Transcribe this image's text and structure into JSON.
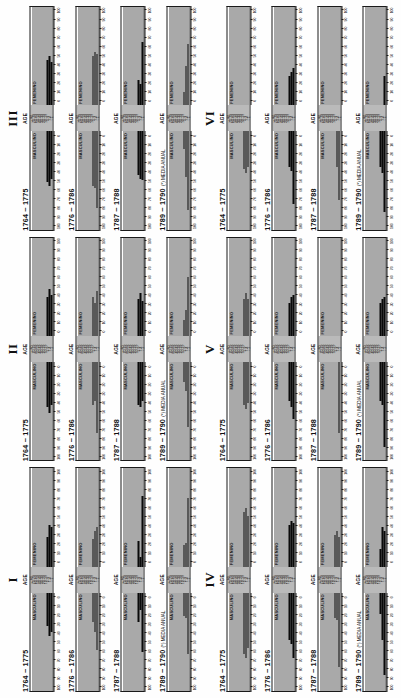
{
  "figure": {
    "orientation": "rotated-90-ccw",
    "panel_count": 6,
    "pyramids_per_panel": 4,
    "axis_header": "AGE",
    "male_label": "MASCULINO",
    "female_label": "FEMENINO",
    "note_symbol": "(*)",
    "note_text": "MEDIA ANUAL",
    "colors": {
      "bar": "#0a0a0a",
      "frame": "#1a1a1a",
      "grid": "#555555",
      "background": "#ffffff"
    }
  },
  "panels": [
    {
      "numeral": "I"
    },
    {
      "numeral": "II"
    },
    {
      "numeral": "III"
    },
    {
      "numeral": "IV"
    },
    {
      "numeral": "V"
    },
    {
      "numeral": "VI"
    }
  ],
  "periods": [
    {
      "label": "1764 ~ 1775",
      "note": ""
    },
    {
      "label": "1776 ~ 1786",
      "note": ""
    },
    {
      "label": "1787 ~ 1788",
      "note": ""
    },
    {
      "label": "1789 ~ 1790",
      "note": "(*) MEDIA ANUAL"
    }
  ],
  "age_groups": [
    "+ 80",
    "70-79",
    "60-69",
    "50-59",
    "40-49",
    "30-39",
    "20-29",
    "10-19",
    "5-9",
    "1-4",
    "- 1"
  ],
  "x_ticks": [
    "0",
    "10",
    "20",
    "30",
    "40",
    "50",
    "60",
    "70",
    "80",
    "90",
    "100"
  ],
  "chart_data": {
    "type": "bar",
    "xlabel": "",
    "ylabel": "AGE",
    "xlim": [
      0,
      100
    ],
    "grid": true,
    "legend": [
      "MASCULINO",
      "FEMENINO"
    ],
    "panels": [
      {
        "numeral": "I",
        "pyramids": [
          {
            "period": "1764 ~ 1775",
            "male": [
              0,
              0,
              0,
              0,
              0,
              0,
              0,
              0,
              34,
              44,
              40
            ],
            "female": [
              0,
              0,
              0,
              0,
              0,
              0,
              0,
              0,
              30,
              42,
              40
            ]
          },
          {
            "period": "1776 ~ 1786",
            "male": [
              0,
              0,
              0,
              0,
              0,
              0,
              0,
              0,
              30,
              40,
              58
            ],
            "female": [
              0,
              0,
              0,
              0,
              0,
              0,
              0,
              0,
              28,
              36,
              40
            ]
          },
          {
            "period": "1787 ~ 1788",
            "male": [
              0,
              0,
              0,
              0,
              0,
              0,
              0,
              0,
              30,
              18,
              60
            ],
            "female": [
              0,
              0,
              0,
              0,
              0,
              0,
              0,
              0,
              26,
              10,
              72
            ]
          },
          {
            "period": "1789 ~ 1790",
            "male": [
              0,
              0,
              0,
              0,
              0,
              0,
              0,
              0,
              24,
              26,
              62
            ],
            "female": [
              0,
              0,
              0,
              0,
              0,
              0,
              0,
              0,
              22,
              24,
              70
            ]
          }
        ]
      },
      {
        "numeral": "II",
        "pyramids": [
          {
            "period": "1764 ~ 1775",
            "male": [
              0,
              0,
              0,
              0,
              0,
              0,
              0,
              0,
              46,
              52,
              44
            ],
            "female": [
              0,
              0,
              0,
              0,
              0,
              0,
              0,
              0,
              40,
              48,
              42
            ]
          },
          {
            "period": "1776 ~ 1786",
            "male": [
              0,
              0,
              0,
              0,
              0,
              0,
              0,
              0,
              44,
              40,
              72
            ],
            "female": [
              0,
              0,
              0,
              0,
              0,
              0,
              0,
              0,
              40,
              34,
              46
            ]
          },
          {
            "period": "1787 ~ 1788",
            "male": [
              0,
              0,
              0,
              0,
              0,
              0,
              0,
              0,
              44,
              46,
              40
            ],
            "female": [
              0,
              0,
              0,
              0,
              0,
              0,
              0,
              0,
              38,
              44,
              36
            ]
          },
          {
            "period": "1789 ~ 1790",
            "male": [
              0,
              0,
              0,
              0,
              0,
              0,
              0,
              0,
              20,
              30,
              66
            ],
            "female": [
              0,
              0,
              0,
              0,
              0,
              0,
              0,
              0,
              16,
              26,
              60
            ]
          }
        ]
      },
      {
        "numeral": "III",
        "pyramids": [
          {
            "period": "1764 ~ 1775",
            "male": [
              0,
              0,
              0,
              0,
              0,
              0,
              0,
              0,
              52,
              56,
              48
            ],
            "female": [
              0,
              0,
              0,
              0,
              0,
              0,
              0,
              0,
              46,
              50,
              44
            ]
          },
          {
            "period": "1776 ~ 1786",
            "male": [
              0,
              0,
              0,
              0,
              0,
              0,
              0,
              0,
              56,
              58,
              78
            ],
            "female": [
              0,
              0,
              0,
              0,
              0,
              0,
              0,
              0,
              50,
              54,
              52
            ]
          },
          {
            "period": "1787 ~ 1788",
            "male": [
              0,
              0,
              0,
              0,
              0,
              0,
              0,
              0,
              44,
              48,
              50
            ],
            "female": [
              0,
              0,
              0,
              0,
              0,
              0,
              0,
              0,
              26,
              22,
              64
            ]
          },
          {
            "period": "1789 ~ 1790",
            "male": [
              0,
              0,
              0,
              0,
              0,
              0,
              0,
              0,
              18,
              46,
              80
            ],
            "female": [
              0,
              0,
              0,
              0,
              0,
              0,
              0,
              0,
              14,
              40,
              62
            ]
          }
        ]
      },
      {
        "numeral": "IV",
        "pyramids": [
          {
            "period": "1764 ~ 1775",
            "male": [
              0,
              0,
              0,
              0,
              0,
              0,
              0,
              0,
              62,
              66,
              56
            ],
            "female": [
              0,
              0,
              0,
              0,
              0,
              0,
              0,
              0,
              56,
              60,
              52
            ]
          },
          {
            "period": "1776 ~ 1786",
            "male": [
              0,
              0,
              0,
              0,
              0,
              0,
              0,
              0,
              48,
              52,
              66
            ],
            "female": [
              0,
              0,
              0,
              0,
              0,
              0,
              0,
              0,
              42,
              46,
              44
            ]
          },
          {
            "period": "1787 ~ 1788",
            "male": [
              0,
              0,
              0,
              0,
              0,
              0,
              0,
              0,
              26,
              28,
              76
            ],
            "female": [
              0,
              0,
              0,
              0,
              0,
              0,
              0,
              0,
              32,
              36,
              30
            ]
          },
          {
            "period": "1789 ~ 1790",
            "male": [
              0,
              0,
              0,
              0,
              0,
              0,
              0,
              0,
              22,
              48,
              84
            ],
            "female": [
              0,
              0,
              0,
              0,
              0,
              0,
              0,
              0,
              18,
              40,
              36
            ]
          }
        ]
      },
      {
        "numeral": "V",
        "pyramids": [
          {
            "period": "1764 ~ 1775",
            "male": [
              0,
              0,
              0,
              0,
              0,
              0,
              0,
              0,
              44,
              48,
              42
            ],
            "female": [
              0,
              0,
              0,
              0,
              0,
              0,
              0,
              0,
              38,
              44,
              38
            ]
          },
          {
            "period": "1776 ~ 1786",
            "male": [
              0,
              0,
              0,
              0,
              0,
              0,
              0,
              0,
              40,
              46,
              58
            ],
            "female": [
              0,
              0,
              0,
              0,
              0,
              0,
              0,
              0,
              34,
              40,
              42
            ]
          },
          {
            "period": "1787 ~ 1788",
            "male": [
              0,
              0,
              0,
              0,
              0,
              0,
              0,
              0,
              0,
              0,
              72
            ],
            "female": [
              0,
              0,
              0,
              0,
              0,
              0,
              0,
              0,
              0,
              0,
              0
            ]
          },
          {
            "period": "1789 ~ 1790",
            "male": [
              0,
              0,
              0,
              0,
              0,
              0,
              0,
              0,
              40,
              44,
              86
            ],
            "female": [
              0,
              0,
              0,
              0,
              0,
              0,
              0,
              0,
              34,
              38,
              40
            ]
          }
        ]
      },
      {
        "numeral": "VI",
        "pyramids": [
          {
            "period": "1764 ~ 1775",
            "male": [
              0,
              0,
              0,
              0,
              0,
              0,
              0,
              0,
              38,
              42,
              36
            ],
            "female": [
              0,
              0,
              0,
              0,
              0,
              0,
              0,
              0,
              0,
              0,
              0
            ]
          },
          {
            "period": "1776 ~ 1786",
            "male": [
              0,
              0,
              0,
              0,
              0,
              0,
              0,
              0,
              36,
              40,
              74
            ],
            "female": [
              0,
              0,
              0,
              0,
              0,
              0,
              0,
              0,
              30,
              34,
              38
            ]
          },
          {
            "period": "1787 ~ 1788",
            "male": [
              0,
              0,
              0,
              0,
              0,
              0,
              0,
              0,
              0,
              36,
              70
            ],
            "female": [
              0,
              0,
              0,
              0,
              0,
              0,
              0,
              0,
              0,
              0,
              0
            ]
          },
          {
            "period": "1789 ~ 1790",
            "male": [
              0,
              0,
              0,
              0,
              0,
              0,
              0,
              0,
              36,
              42,
              82
            ],
            "female": [
              0,
              0,
              0,
              0,
              0,
              0,
              0,
              0,
              0,
              0,
              30
            ]
          }
        ]
      }
    ]
  }
}
